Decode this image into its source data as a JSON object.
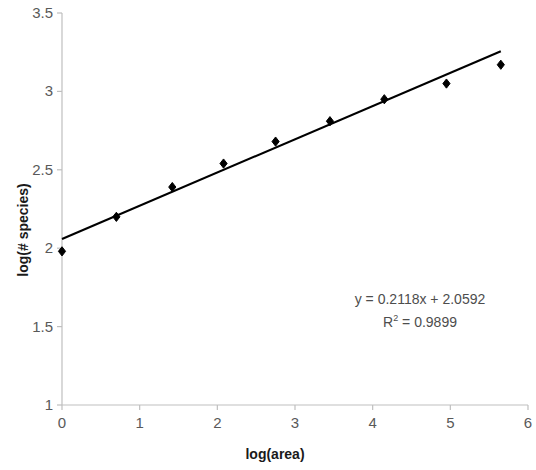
{
  "chart_data": {
    "type": "scatter",
    "title": "",
    "xlabel": "log(area)",
    "ylabel": "log(# species)",
    "xlim": [
      0,
      6
    ],
    "ylim": [
      1,
      3.5
    ],
    "xticks": [
      "0",
      "1",
      "2",
      "3",
      "4",
      "5",
      "6"
    ],
    "yticks": [
      "1",
      "1.5",
      "2",
      "2.5",
      "3",
      "3.5"
    ],
    "xtick_values": [
      0,
      1,
      2,
      3,
      4,
      5,
      6
    ],
    "ytick_values": [
      1,
      1.5,
      2,
      2.5,
      3,
      3.5
    ],
    "grid": false,
    "legend": false,
    "marker": "diamond",
    "marker_color": "#000000",
    "line_color": "#000000",
    "axis_color": "#bfbfbf",
    "series": [
      {
        "name": "data",
        "points": [
          {
            "x": 0.0,
            "y": 1.98
          },
          {
            "x": 0.7,
            "y": 2.2
          },
          {
            "x": 1.42,
            "y": 2.39
          },
          {
            "x": 2.08,
            "y": 2.54
          },
          {
            "x": 2.75,
            "y": 2.68
          },
          {
            "x": 3.45,
            "y": 2.81
          },
          {
            "x": 4.15,
            "y": 2.95
          },
          {
            "x": 4.95,
            "y": 3.05
          },
          {
            "x": 5.65,
            "y": 3.17
          }
        ]
      }
    ],
    "trendline": {
      "slope": 0.2118,
      "intercept": 2.0592,
      "x_start": 0.0,
      "x_end": 5.65,
      "r_squared": 0.9899
    },
    "annotations": {
      "equation": "y = 0.2118x + 2.0592",
      "r_squared_prefix": "R",
      "r_squared_exponent": "2",
      "r_squared_value": " = 0.9899"
    }
  }
}
